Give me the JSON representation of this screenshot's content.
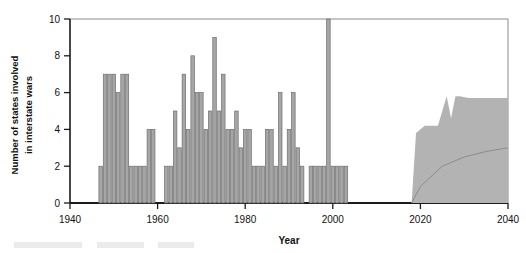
{
  "chart_data": {
    "type": "bar",
    "title": "",
    "subtitle": "",
    "xlabel": "Year",
    "ylabel": "Number of states involved\nin interstate wars",
    "ylabel_line1": "Number of states involved",
    "ylabel_line2": "in interstate wars",
    "xlim": [
      1940,
      2040
    ],
    "ylim": [
      0,
      10
    ],
    "xticks": [
      1940,
      1960,
      1980,
      2000,
      2020,
      2040
    ],
    "xtick_labels": [
      "1940",
      "1960",
      "1980",
      "2000",
      "2020",
      "2040"
    ],
    "yticks": [
      0,
      2,
      4,
      6,
      8,
      10
    ],
    "ytick_labels": [
      "0",
      "2",
      "4",
      "6",
      "8",
      "10"
    ],
    "grid": false,
    "legend": "none",
    "bar_color": "#a6a6a6",
    "bar_edge_color": "#6e6e6e",
    "band_color": "#b3b3b3",
    "line_color": "#8c8c8c",
    "axis_color": "#1a1a1a",
    "series": [
      {
        "name": "States involved in interstate wars (historical)",
        "x": [
          1947,
          1948,
          1949,
          1950,
          1951,
          1952,
          1953,
          1954,
          1955,
          1956,
          1957,
          1958,
          1959,
          1962,
          1963,
          1964,
          1965,
          1966,
          1967,
          1968,
          1969,
          1970,
          1971,
          1972,
          1973,
          1974,
          1975,
          1976,
          1977,
          1978,
          1979,
          1980,
          1981,
          1982,
          1983,
          1984,
          1985,
          1986,
          1987,
          1988,
          1989,
          1990,
          1991,
          1992,
          1993,
          1995,
          1996,
          1997,
          1998,
          1999,
          2000,
          2001,
          2002,
          2003
        ],
        "values": [
          2,
          7,
          7,
          7,
          6,
          7,
          7,
          2,
          2,
          2,
          2,
          4,
          4,
          2,
          2,
          5,
          3,
          7,
          4,
          8,
          6,
          6,
          4,
          5,
          9,
          5,
          7,
          4,
          4,
          5,
          3,
          4,
          4,
          2,
          2,
          2,
          4,
          4,
          2,
          6,
          2,
          4,
          6,
          3,
          2,
          2,
          2,
          2,
          2,
          10,
          2,
          2,
          2,
          2
        ]
      },
      {
        "name": "Projected trend (median)",
        "x": [
          2018,
          2020,
          2025,
          2030,
          2035,
          2040
        ],
        "values": [
          0.0,
          0.9,
          2.0,
          2.5,
          2.8,
          3.0
        ]
      }
    ],
    "uncertainty_band": {
      "name": "Projection uncertainty band",
      "x": [
        2018,
        2019,
        2021,
        2024,
        2025,
        2026,
        2027,
        2028,
        2029,
        2031,
        2040
      ],
      "upper": [
        0.0,
        3.8,
        4.2,
        4.2,
        5.0,
        5.8,
        4.6,
        5.8,
        5.8,
        5.7,
        5.7
      ],
      "lower": [
        0.0,
        0.0,
        0.0,
        0.0,
        0.0,
        0.0,
        0.0,
        0.0,
        0.0,
        0.0,
        0.0
      ]
    },
    "annotations": []
  }
}
